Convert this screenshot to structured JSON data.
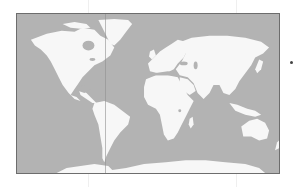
{
  "map": {
    "type": "world-map",
    "projection": "equirectangular",
    "style": "grayscale",
    "colors": {
      "ocean": "#b3b3b3",
      "land": "#f7f7f7",
      "border": "#6d6d6d",
      "background": "#ffffff"
    },
    "regions": [
      "North America",
      "Greenland",
      "South America",
      "Europe",
      "Africa",
      "Asia",
      "Australia",
      "Antarctica"
    ]
  },
  "marker": {
    "shape": "dot",
    "color": "#444444"
  }
}
